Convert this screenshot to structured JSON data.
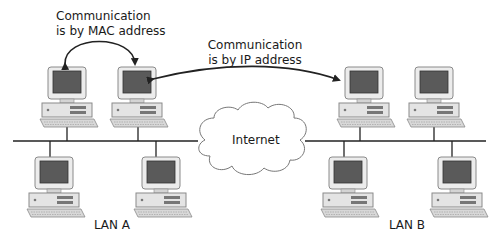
{
  "annotations": {
    "mac_line1": "Communication",
    "mac_line2": "is by MAC address",
    "ip_line1": "Communication",
    "ip_line2": "is by IP address"
  },
  "cloud": {
    "label": "Internet"
  },
  "lans": [
    {
      "label": "LAN A",
      "computers": 4
    },
    {
      "label": "LAN B",
      "computers": 4
    }
  ],
  "colors": {
    "line": "#222222",
    "screen": "#555555",
    "case": "#e6e6e6",
    "case_edge": "#9a9a9a"
  }
}
